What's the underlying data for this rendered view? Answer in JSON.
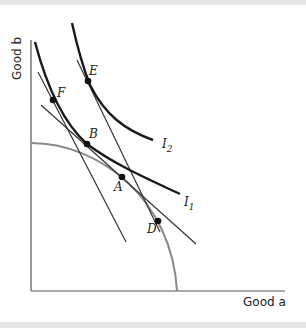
{
  "figure": {
    "x_axis_label": "Good a",
    "y_axis_label": "Good b",
    "curves": {
      "I1": {
        "label": "I",
        "subscript": "1"
      },
      "I2": {
        "label": "I",
        "subscript": "2"
      },
      "ppf": {
        "label": ""
      }
    },
    "points": {
      "A": "A",
      "B": "B",
      "D": "D",
      "E": "E",
      "F": "F"
    },
    "colors": {
      "indifference": "#1a1a1a",
      "ppf": "#8a8a8a",
      "lines": "#333333",
      "points": "#111111"
    }
  }
}
